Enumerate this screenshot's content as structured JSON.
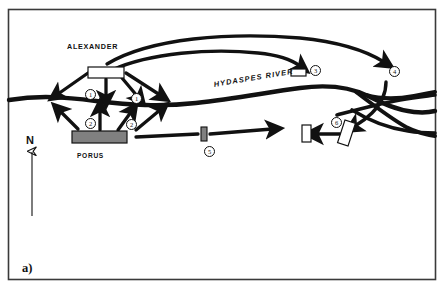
{
  "figure": {
    "panel_label": "a)",
    "width": 444,
    "height": 289,
    "frame_color": "#3a3a3a",
    "background": "#ffffff",
    "ink_color": "#111111",
    "force_fill_friendly": "#ffffff",
    "force_fill_enemy": "#808080"
  },
  "labels": {
    "alexander": "ALEXANDER",
    "porus": "PORUS",
    "river": "HYDASPES RIVER",
    "north": "N"
  },
  "markers": [
    {
      "id": "marker-1a",
      "number": "1",
      "x": 85,
      "y": 89
    },
    {
      "id": "marker-1b",
      "number": "1",
      "x": 131,
      "y": 93
    },
    {
      "id": "marker-2a",
      "number": "2",
      "x": 85,
      "y": 118
    },
    {
      "id": "marker-2b",
      "number": "2",
      "x": 126,
      "y": 119
    },
    {
      "id": "marker-3",
      "number": "3",
      "x": 310,
      "y": 65
    },
    {
      "id": "marker-4",
      "number": "4",
      "x": 389,
      "y": 66
    },
    {
      "id": "marker-5",
      "number": "5",
      "x": 204,
      "y": 146
    },
    {
      "id": "marker-6",
      "number": "6",
      "x": 331,
      "y": 117
    }
  ],
  "units": [
    {
      "id": "unit-alexander-main",
      "side": "alexander",
      "fill": "#ffffff",
      "x": 88,
      "y": 67,
      "w": 36,
      "h": 11
    },
    {
      "id": "unit-porus-main",
      "side": "porus",
      "fill": "#808080",
      "x": 72,
      "y": 131,
      "w": 55,
      "h": 12
    },
    {
      "id": "unit-detachment-3",
      "side": "alexander",
      "fill": "#ffffff",
      "x": 291,
      "y": 69,
      "w": 15,
      "h": 7
    },
    {
      "id": "unit-porus-5",
      "side": "porus",
      "fill": "#808080",
      "x": 201,
      "y": 127,
      "w": 6,
      "h": 14
    },
    {
      "id": "unit-left-6",
      "side": "alexander",
      "fill": "#ffffff",
      "x": 302,
      "y": 125,
      "w": 9,
      "h": 17
    },
    {
      "id": "unit-right-6",
      "side": "alexander",
      "fill": "#ffffff",
      "x": 341,
      "y": 121,
      "w": 11,
      "h": 24,
      "rotation": 18
    }
  ],
  "compass": {
    "direction": "N"
  }
}
